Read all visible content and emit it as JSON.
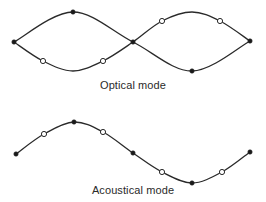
{
  "diagram": {
    "colors": {
      "line": "#2a2a2a",
      "filled_atom": "#1a1a1a",
      "open_atom_fill": "#ffffff"
    },
    "optical": {
      "label": "Optical mode",
      "description": "Two sublattices vibrate out of phase; heavy atoms (filled) and light atoms (open) move in opposite directions",
      "upper_curve": [
        [
          14,
          42
        ],
        [
          43,
          61
        ],
        [
          73,
          71
        ],
        [
          103,
          61
        ],
        [
          133,
          42
        ],
        [
          162,
          21
        ],
        [
          192,
          12
        ],
        [
          220,
          21
        ],
        [
          250,
          41
        ]
      ],
      "lower_curve": [
        [
          14,
          42
        ],
        [
          73,
          12
        ],
        [
          133,
          42
        ],
        [
          192,
          71
        ],
        [
          250,
          41
        ]
      ],
      "filled_atoms": [
        [
          14,
          42
        ],
        [
          73,
          12
        ],
        [
          133,
          42
        ],
        [
          192,
          71
        ],
        [
          250,
          41
        ]
      ],
      "open_atoms": [
        [
          43,
          61
        ],
        [
          103,
          61
        ],
        [
          162,
          21
        ],
        [
          220,
          21
        ]
      ]
    },
    "acoustical": {
      "label": "Acoustical mode",
      "description": "Both sublattices move in phase along a single sinusoidal wave",
      "curve": [
        [
          16,
          154
        ],
        [
          44,
          134
        ],
        [
          74,
          122
        ],
        [
          103,
          132
        ],
        [
          133,
          153
        ],
        [
          162,
          172
        ],
        [
          192,
          183
        ],
        [
          222,
          172
        ],
        [
          250,
          152
        ]
      ],
      "filled_atoms": [
        [
          16,
          154
        ],
        [
          74,
          122
        ],
        [
          133,
          153
        ],
        [
          192,
          183
        ],
        [
          250,
          152
        ]
      ],
      "open_atoms": [
        [
          44,
          134
        ],
        [
          103,
          132
        ],
        [
          162,
          172
        ],
        [
          222,
          172
        ]
      ]
    }
  }
}
